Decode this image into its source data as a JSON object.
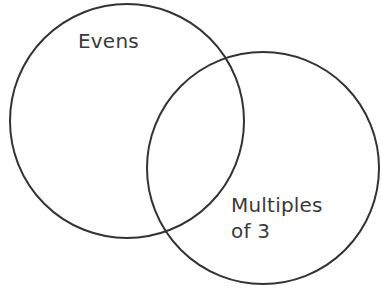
{
  "diagram": {
    "type": "venn",
    "sets": [
      {
        "id": "evens",
        "label": "Evens",
        "circle": {
          "cx": 127,
          "cy": 121,
          "r": 117
        }
      },
      {
        "id": "multiples-of-3",
        "label_line1": "Multiples",
        "label_line2": "of 3",
        "circle": {
          "cx": 263,
          "cy": 168,
          "r": 116
        }
      }
    ],
    "stroke_color": "#333333",
    "text_color": "#3a3a3a",
    "background": "#ffffff"
  }
}
